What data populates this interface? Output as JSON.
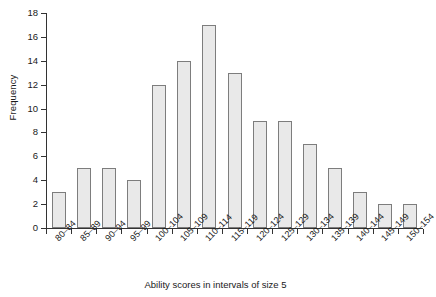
{
  "chart_data": {
    "type": "bar",
    "title": "",
    "subtitle": "",
    "xlabel": "Ability scores in intervals of size 5",
    "ylabel": "Frequency",
    "categories": [
      "80–84",
      "85–89",
      "90–94",
      "95–99",
      "100–104",
      "105–109",
      "110–114",
      "115–119",
      "120–124",
      "125–129",
      "130–134",
      "135–139",
      "140–144",
      "145–149",
      "150–154"
    ],
    "values": [
      3,
      5,
      5,
      4,
      12,
      14,
      17,
      13,
      9,
      9,
      7,
      5,
      3,
      2,
      2
    ],
    "ylim": [
      0,
      18
    ],
    "ytick_step": 2,
    "yticks": [
      0,
      2,
      4,
      6,
      8,
      10,
      12,
      14,
      16,
      18
    ],
    "ytick_labels": [
      "0",
      "2",
      "4",
      "6",
      "8",
      "10",
      "12",
      "14",
      "16",
      "18"
    ],
    "grid": false,
    "legend": null,
    "bar_fill_color": "#e9e9e9",
    "bar_border_color": "#7d7d7d",
    "axis_color": "#333333",
    "text_color": "#1a1a1a",
    "background_color": "#ffffff"
  }
}
